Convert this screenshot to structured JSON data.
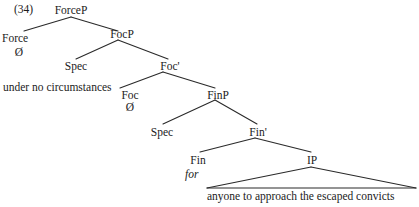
{
  "figure": {
    "example_number": "(34)",
    "null_symbol": "Ø",
    "nodes": {
      "forcep": "ForceP",
      "force": "Force",
      "focp": "FocP",
      "foc_spec": "Spec",
      "foc_bar": "Foc'",
      "foc": "Foc",
      "finp": "FinP",
      "fin_spec": "Spec",
      "fin_bar": "Fin'",
      "fin": "Fin",
      "ip": "IP"
    },
    "terminals": {
      "force_null": "Ø",
      "spec_focp_text": "under no circumstances",
      "foc_null": "Ø",
      "fin_text": "for",
      "ip_text": "anyone to approach the escaped convicts"
    },
    "colors": {
      "ink": "#1b1b1b",
      "background": "#ffffff",
      "line": "#2a2a2a"
    }
  }
}
